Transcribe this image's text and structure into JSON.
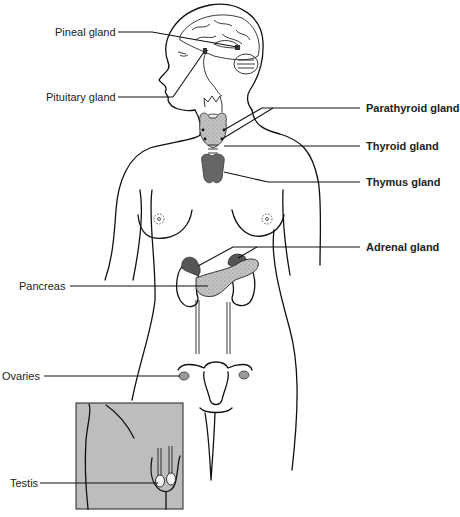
{
  "diagram": {
    "labels_left": [
      {
        "id": "pineal",
        "text": "Pineal gland"
      },
      {
        "id": "pituitary",
        "text": "Pituitary gland"
      },
      {
        "id": "pancreas",
        "text": "Pancreas"
      },
      {
        "id": "ovaries",
        "text": "Ovaries"
      },
      {
        "id": "testis",
        "text": "Testis"
      }
    ],
    "labels_right": [
      {
        "id": "parathyroid",
        "text": "Parathyroid gland"
      },
      {
        "id": "thyroid",
        "text": "Thyroid gland"
      },
      {
        "id": "thymus",
        "text": "Thymus gland"
      },
      {
        "id": "adrenal",
        "text": "Adrenal gland"
      }
    ],
    "colors": {
      "line": "#111111",
      "gland_dark": "#5a5a5a",
      "pancreas_fill": "#b9b9b9",
      "inset_bg": "#bdbdbd",
      "label_text": "#222222"
    }
  }
}
